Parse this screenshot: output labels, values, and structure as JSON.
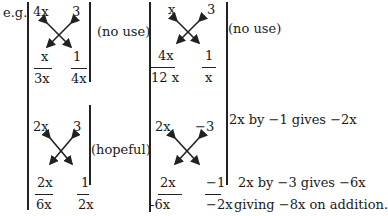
{
  "label": "e.g.",
  "examples": [
    {
      "id": "top-left",
      "top_left": "4x",
      "top_right": "3",
      "bottom_left_num": "x",
      "bottom_left_den": "3x",
      "bottom_right_num": "1",
      "bottom_right_den": "4x",
      "comment": "(no use)"
    },
    {
      "id": "top-right",
      "top_left": "x",
      "top_right": "3",
      "bottom_left_num": "4x",
      "bottom_left_den": "12 x",
      "bottom_right_num": "1",
      "bottom_right_den": "x",
      "comment": "(no use)"
    },
    {
      "id": "bottom-left",
      "top_left": "2x",
      "top_right": "3",
      "bottom_left_num": "2x",
      "bottom_left_den": "6x",
      "bottom_right_num": "1",
      "bottom_right_den": "2x",
      "comment": "(hopeful)"
    },
    {
      "id": "bottom-right",
      "top_left": "2x",
      "top_right": "−3",
      "bottom_left_num": "2x",
      "bottom_left_den": "-6x",
      "bottom_right_num": "−1",
      "bottom_right_den": "−2x",
      "notes": [
        "2x by −1  gives  −2x",
        "2x by −3  gives  −6x",
        "giving  −8x on addition."
      ]
    }
  ]
}
